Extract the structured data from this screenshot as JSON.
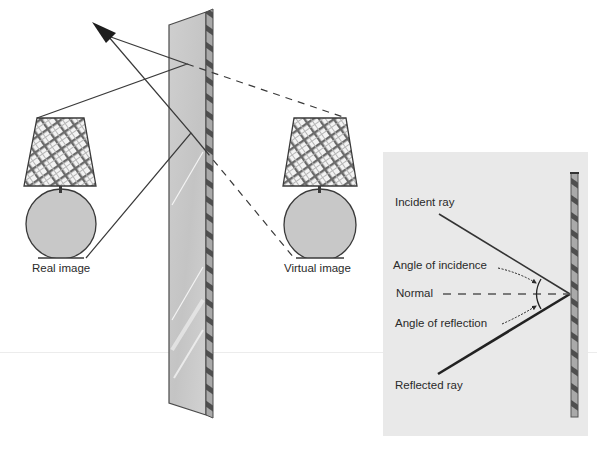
{
  "diagram": {
    "left_scene": {
      "real_lamp_label": "Real image",
      "virtual_lamp_label": "Virtual image",
      "mirror": "plane-mirror",
      "rays": [
        "upper-ray-to-eye",
        "lower-ray-to-eye"
      ],
      "virtual_rays": [
        "dashed-upper-extension",
        "dashed-lower-extension"
      ]
    },
    "right_panel": {
      "labels": {
        "incident_ray": "Incident ray",
        "angle_of_incidence": "Angle of incidence",
        "normal": "Normal",
        "angle_of_reflection": "Angle of reflection",
        "reflected_ray": "Reflected ray"
      }
    },
    "colors": {
      "line": "#3a3a3a",
      "mirror_face": "#c9c9c9",
      "mirror_edge": "#6e6e6e",
      "panel_bg": "#e9e9e9",
      "lamp_body": "#c6c6c6",
      "shade_bg": "#f2f2f2"
    }
  }
}
